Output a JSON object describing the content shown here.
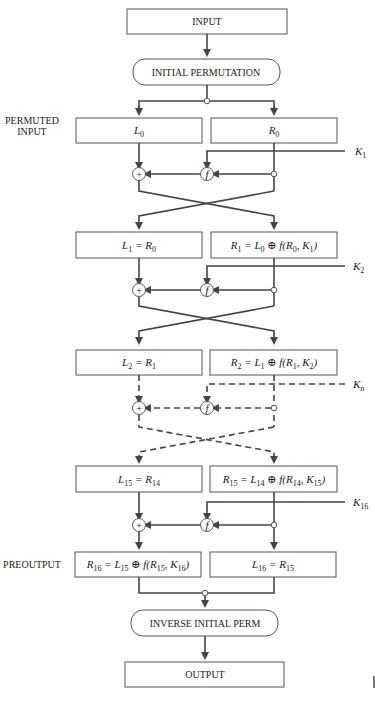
{
  "diagram": {
    "title_blocks": {
      "input": "INPUT",
      "initial_permutation": "INITIAL PERMUTATION",
      "inverse_initial_perm": "INVERSE INITIAL PERM",
      "output": "OUTPUT"
    },
    "side_labels": {
      "permuted_line1": "PERMUTED",
      "permuted_line2": "INPUT",
      "preoutput": "PREOUTPUT"
    },
    "symbols": {
      "xor": "+",
      "f": "f"
    },
    "rounds": [
      {
        "left": {
          "var": "L",
          "sub": "0"
        },
        "right": {
          "var": "R",
          "sub": "0"
        },
        "key": {
          "var": "K",
          "sub": "1"
        },
        "style": "solid"
      },
      {
        "left": {
          "text": "L",
          "sub": "1",
          "eq": " = R",
          "eqsub": "0"
        },
        "right": {
          "text": "R",
          "sub": "1",
          "eq": " = L",
          "eqsub": "0",
          "f": "f(R",
          "fsub": "0",
          "f2": ", K",
          "f2sub": "1",
          "fend": ")"
        },
        "key": {
          "var": "K",
          "sub": "2"
        },
        "style": "solid"
      },
      {
        "left": {
          "text": "L",
          "sub": "2",
          "eq": " = R",
          "eqsub": "1"
        },
        "right": {
          "text": "R",
          "sub": "2",
          "eq": " = L",
          "eqsub": "1",
          "f": "f(R",
          "fsub": "1",
          "f2": ", K",
          "f2sub": "2",
          "fend": ")"
        },
        "key": {
          "var": "K",
          "sub": "n"
        },
        "style": "dashed"
      },
      {
        "left": {
          "text": "L",
          "sub": "15",
          "eq": " = R",
          "eqsub": "14"
        },
        "right": {
          "text": "R",
          "sub": "15",
          "eq": " = L",
          "eqsub": "14",
          "f": "f(R",
          "fsub": "14",
          "f2": ", K",
          "f2sub": "15",
          "fend": ")"
        },
        "key": {
          "var": "K",
          "sub": "16"
        },
        "style": "solid"
      }
    ],
    "preoutput": {
      "left": {
        "text": "R",
        "sub": "16",
        "eq": " = L",
        "eqsub": "15",
        "f": "f(R",
        "fsub": "15",
        "f2": ", K",
        "f2sub": "16",
        "fend": ")"
      },
      "right": {
        "text": "L",
        "sub": "16",
        "eq": " = R",
        "eqsub": "15"
      }
    },
    "colors": {
      "line": "#444444",
      "box_border": "#555555",
      "text": "#222222",
      "background": "#ffffff"
    }
  }
}
